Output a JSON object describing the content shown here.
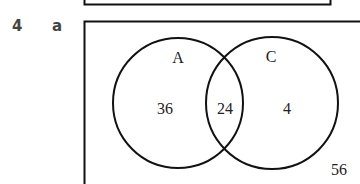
{
  "question": {
    "number": "4",
    "part": "a"
  },
  "venn": {
    "sets": [
      {
        "name": "A",
        "only": "36"
      },
      {
        "name": "C",
        "only": "4"
      }
    ],
    "intersection": "24",
    "outside": "56"
  }
}
